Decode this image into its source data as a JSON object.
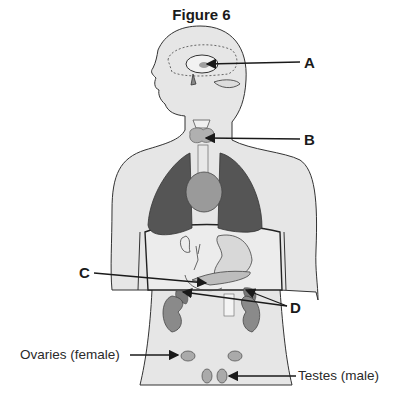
{
  "figure": {
    "title": "Figure 6",
    "labels": {
      "A": "A",
      "B": "B",
      "C": "C",
      "D": "D"
    },
    "text_labels": {
      "ovaries": "Ovaries (female)",
      "testes": "Testes (male)"
    },
    "colors": {
      "body_fill": "#e6e6e6",
      "outline": "#333333",
      "lung": "#555555",
      "organ_fill": "#9a9a9a",
      "light_organ": "#d0d0d0",
      "arrow": "#1a1a1a"
    }
  }
}
